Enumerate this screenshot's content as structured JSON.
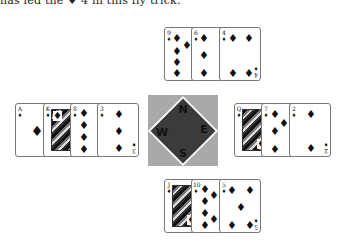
{
  "caption": "has led the ♦ 4 in this fly trick.",
  "compass": {
    "north": "N",
    "east": "E",
    "south": "S",
    "west": "W",
    "box_color": "#a9a9a9",
    "diamond_color": "#3b3b3b"
  },
  "hands": {
    "north": [
      {
        "rank": "9",
        "suit": "♦"
      },
      {
        "rank": "6",
        "suit": "♦"
      },
      {
        "rank": "4",
        "suit": "♦"
      }
    ],
    "west": [
      {
        "rank": "A",
        "suit": "♦"
      },
      {
        "rank": "K",
        "suit": "♦"
      },
      {
        "rank": "8",
        "suit": "♦"
      },
      {
        "rank": "3",
        "suit": "♦"
      }
    ],
    "east": [
      {
        "rank": "Q",
        "suit": "♦"
      },
      {
        "rank": "7",
        "suit": "♦"
      },
      {
        "rank": "2",
        "suit": "♦"
      }
    ],
    "south": [
      {
        "rank": "J",
        "suit": "♦"
      },
      {
        "rank": "10",
        "suit": "♦"
      },
      {
        "rank": "5",
        "suit": "♦"
      }
    ]
  }
}
